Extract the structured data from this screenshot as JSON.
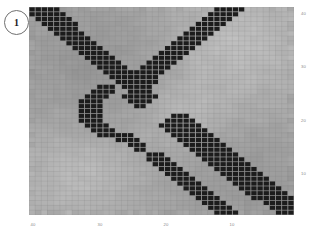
{
  "figure": {
    "panel_label": "1",
    "background_color": "#ffffff"
  },
  "chart_data": {
    "type": "heatmap",
    "title": "",
    "subtitle": "",
    "xlabel": "",
    "ylabel": "",
    "grid": true,
    "legend": "none",
    "colormap": "grays",
    "color_low": "#1c1c1c",
    "color_high": "#d8d8d8",
    "background_color": "#9f9f9f",
    "xlim": [
      45,
      2
    ],
    "ylim": [
      45,
      2
    ],
    "x_ticks": [
      40,
      30,
      20,
      10
    ],
    "x_tick_labels": [
      "40",
      "30",
      "20",
      "10"
    ],
    "x_tick_positions_px": [
      33,
      100,
      166,
      232
    ],
    "y_ticks": [
      40,
      30,
      20,
      10
    ],
    "y_tick_labels": [
      "40",
      "30",
      "20",
      "10"
    ],
    "y_tick_positions_px": [
      14,
      67,
      121,
      174
    ],
    "n_rows": 43,
    "n_cols": 43,
    "cell_px": 6.16,
    "value_levels": {
      "dark": 0.06,
      "mid_dark": 0.58,
      "mid": 0.64,
      "mid_light": 0.72,
      "light": 0.83
    },
    "dark_cells": [
      [
        0,
        0
      ],
      [
        0,
        1
      ],
      [
        0,
        2
      ],
      [
        0,
        3
      ],
      [
        0,
        4
      ],
      [
        0,
        30
      ],
      [
        0,
        31
      ],
      [
        0,
        32
      ],
      [
        0,
        33
      ],
      [
        0,
        34
      ],
      [
        1,
        0
      ],
      [
        1,
        1
      ],
      [
        1,
        2
      ],
      [
        1,
        3
      ],
      [
        1,
        4
      ],
      [
        1,
        5
      ],
      [
        1,
        29
      ],
      [
        1,
        30
      ],
      [
        1,
        31
      ],
      [
        1,
        32
      ],
      [
        1,
        33
      ],
      [
        2,
        1
      ],
      [
        2,
        2
      ],
      [
        2,
        3
      ],
      [
        2,
        4
      ],
      [
        2,
        5
      ],
      [
        2,
        6
      ],
      [
        2,
        28
      ],
      [
        2,
        29
      ],
      [
        2,
        30
      ],
      [
        2,
        31
      ],
      [
        2,
        32
      ],
      [
        3,
        2
      ],
      [
        3,
        3
      ],
      [
        3,
        4
      ],
      [
        3,
        5
      ],
      [
        3,
        6
      ],
      [
        3,
        7
      ],
      [
        3,
        27
      ],
      [
        3,
        28
      ],
      [
        3,
        29
      ],
      [
        3,
        30
      ],
      [
        3,
        31
      ],
      [
        4,
        3
      ],
      [
        4,
        4
      ],
      [
        4,
        5
      ],
      [
        4,
        6
      ],
      [
        4,
        7
      ],
      [
        4,
        26
      ],
      [
        4,
        27
      ],
      [
        4,
        28
      ],
      [
        4,
        29
      ],
      [
        4,
        30
      ],
      [
        5,
        4
      ],
      [
        5,
        5
      ],
      [
        5,
        6
      ],
      [
        5,
        7
      ],
      [
        5,
        8
      ],
      [
        5,
        25
      ],
      [
        5,
        26
      ],
      [
        5,
        27
      ],
      [
        5,
        28
      ],
      [
        5,
        29
      ],
      [
        6,
        5
      ],
      [
        6,
        6
      ],
      [
        6,
        7
      ],
      [
        6,
        8
      ],
      [
        6,
        9
      ],
      [
        6,
        24
      ],
      [
        6,
        25
      ],
      [
        6,
        26
      ],
      [
        6,
        27
      ],
      [
        6,
        28
      ],
      [
        7,
        6
      ],
      [
        7,
        7
      ],
      [
        7,
        8
      ],
      [
        7,
        9
      ],
      [
        7,
        10
      ],
      [
        7,
        23
      ],
      [
        7,
        24
      ],
      [
        7,
        25
      ],
      [
        7,
        26
      ],
      [
        7,
        27
      ],
      [
        8,
        7
      ],
      [
        8,
        8
      ],
      [
        8,
        9
      ],
      [
        8,
        10
      ],
      [
        8,
        11
      ],
      [
        8,
        22
      ],
      [
        8,
        23
      ],
      [
        8,
        24
      ],
      [
        8,
        25
      ],
      [
        8,
        26
      ],
      [
        9,
        8
      ],
      [
        9,
        9
      ],
      [
        9,
        10
      ],
      [
        9,
        11
      ],
      [
        9,
        12
      ],
      [
        9,
        21
      ],
      [
        9,
        22
      ],
      [
        9,
        23
      ],
      [
        9,
        24
      ],
      [
        9,
        25
      ],
      [
        10,
        9
      ],
      [
        10,
        10
      ],
      [
        10,
        11
      ],
      [
        10,
        12
      ],
      [
        10,
        13
      ],
      [
        10,
        20
      ],
      [
        10,
        21
      ],
      [
        10,
        22
      ],
      [
        10,
        23
      ],
      [
        10,
        24
      ],
      [
        11,
        10
      ],
      [
        11,
        11
      ],
      [
        11,
        12
      ],
      [
        11,
        13
      ],
      [
        11,
        14
      ],
      [
        11,
        19
      ],
      [
        11,
        20
      ],
      [
        11,
        21
      ],
      [
        11,
        22
      ],
      [
        11,
        23
      ],
      [
        12,
        11
      ],
      [
        12,
        12
      ],
      [
        12,
        13
      ],
      [
        12,
        14
      ],
      [
        12,
        15
      ],
      [
        12,
        18
      ],
      [
        12,
        19
      ],
      [
        12,
        20
      ],
      [
        12,
        21
      ],
      [
        12,
        22
      ],
      [
        13,
        12
      ],
      [
        13,
        13
      ],
      [
        13,
        14
      ],
      [
        13,
        15
      ],
      [
        13,
        16
      ],
      [
        13,
        17
      ],
      [
        13,
        18
      ],
      [
        13,
        19
      ],
      [
        13,
        20
      ],
      [
        13,
        21
      ],
      [
        14,
        13
      ],
      [
        14,
        14
      ],
      [
        14,
        15
      ],
      [
        14,
        16
      ],
      [
        14,
        17
      ],
      [
        14,
        18
      ],
      [
        14,
        19
      ],
      [
        14,
        20
      ],
      [
        15,
        14
      ],
      [
        15,
        15
      ],
      [
        15,
        16
      ],
      [
        15,
        17
      ],
      [
        15,
        18
      ],
      [
        15,
        19
      ],
      [
        15,
        20
      ],
      [
        16,
        11
      ],
      [
        16,
        12
      ],
      [
        16,
        13
      ],
      [
        16,
        15
      ],
      [
        16,
        16
      ],
      [
        16,
        17
      ],
      [
        16,
        18
      ],
      [
        16,
        19
      ],
      [
        17,
        10
      ],
      [
        17,
        11
      ],
      [
        17,
        12
      ],
      [
        17,
        13
      ],
      [
        17,
        16
      ],
      [
        17,
        17
      ],
      [
        17,
        18
      ],
      [
        17,
        19
      ],
      [
        18,
        9
      ],
      [
        18,
        10
      ],
      [
        18,
        11
      ],
      [
        18,
        12
      ],
      [
        18,
        15
      ],
      [
        18,
        16
      ],
      [
        18,
        17
      ],
      [
        18,
        18
      ],
      [
        18,
        19
      ],
      [
        18,
        20
      ],
      [
        19,
        8
      ],
      [
        19,
        9
      ],
      [
        19,
        10
      ],
      [
        19,
        11
      ],
      [
        19,
        16
      ],
      [
        19,
        17
      ],
      [
        19,
        18
      ],
      [
        19,
        19
      ],
      [
        20,
        8
      ],
      [
        20,
        9
      ],
      [
        20,
        10
      ],
      [
        20,
        11
      ],
      [
        20,
        17
      ],
      [
        20,
        18
      ],
      [
        21,
        8
      ],
      [
        21,
        9
      ],
      [
        21,
        10
      ],
      [
        21,
        11
      ],
      [
        22,
        8
      ],
      [
        22,
        9
      ],
      [
        22,
        10
      ],
      [
        22,
        11
      ],
      [
        22,
        23
      ],
      [
        22,
        24
      ],
      [
        22,
        25
      ],
      [
        23,
        8
      ],
      [
        23,
        9
      ],
      [
        23,
        10
      ],
      [
        23,
        11
      ],
      [
        23,
        22
      ],
      [
        23,
        23
      ],
      [
        23,
        24
      ],
      [
        23,
        25
      ],
      [
        23,
        26
      ],
      [
        24,
        9
      ],
      [
        24,
        10
      ],
      [
        24,
        11
      ],
      [
        24,
        12
      ],
      [
        24,
        21
      ],
      [
        24,
        22
      ],
      [
        24,
        23
      ],
      [
        24,
        24
      ],
      [
        24,
        25
      ],
      [
        24,
        26
      ],
      [
        24,
        27
      ],
      [
        25,
        10
      ],
      [
        25,
        11
      ],
      [
        25,
        12
      ],
      [
        25,
        13
      ],
      [
        25,
        22
      ],
      [
        25,
        23
      ],
      [
        25,
        24
      ],
      [
        25,
        25
      ],
      [
        25,
        26
      ],
      [
        25,
        27
      ],
      [
        25,
        28
      ],
      [
        26,
        11
      ],
      [
        26,
        12
      ],
      [
        26,
        13
      ],
      [
        26,
        14
      ],
      [
        26,
        15
      ],
      [
        26,
        16
      ],
      [
        26,
        23
      ],
      [
        26,
        24
      ],
      [
        26,
        25
      ],
      [
        26,
        26
      ],
      [
        26,
        27
      ],
      [
        26,
        28
      ],
      [
        26,
        29
      ],
      [
        27,
        14
      ],
      [
        27,
        15
      ],
      [
        27,
        16
      ],
      [
        27,
        17
      ],
      [
        27,
        24
      ],
      [
        27,
        25
      ],
      [
        27,
        26
      ],
      [
        27,
        27
      ],
      [
        27,
        28
      ],
      [
        27,
        29
      ],
      [
        27,
        30
      ],
      [
        28,
        16
      ],
      [
        28,
        17
      ],
      [
        28,
        18
      ],
      [
        28,
        25
      ],
      [
        28,
        26
      ],
      [
        28,
        27
      ],
      [
        28,
        28
      ],
      [
        28,
        29
      ],
      [
        28,
        30
      ],
      [
        28,
        31
      ],
      [
        29,
        17
      ],
      [
        29,
        18
      ],
      [
        29,
        26
      ],
      [
        29,
        27
      ],
      [
        29,
        28
      ],
      [
        29,
        29
      ],
      [
        29,
        30
      ],
      [
        29,
        31
      ],
      [
        29,
        32
      ],
      [
        30,
        19
      ],
      [
        30,
        20
      ],
      [
        30,
        21
      ],
      [
        30,
        27
      ],
      [
        30,
        28
      ],
      [
        30,
        29
      ],
      [
        30,
        30
      ],
      [
        30,
        31
      ],
      [
        30,
        32
      ],
      [
        30,
        33
      ],
      [
        31,
        19
      ],
      [
        31,
        20
      ],
      [
        31,
        21
      ],
      [
        31,
        22
      ],
      [
        31,
        28
      ],
      [
        31,
        29
      ],
      [
        31,
        30
      ],
      [
        31,
        31
      ],
      [
        31,
        32
      ],
      [
        31,
        33
      ],
      [
        31,
        34
      ],
      [
        32,
        20
      ],
      [
        32,
        21
      ],
      [
        32,
        22
      ],
      [
        32,
        23
      ],
      [
        32,
        29
      ],
      [
        32,
        30
      ],
      [
        32,
        31
      ],
      [
        32,
        32
      ],
      [
        32,
        33
      ],
      [
        32,
        34
      ],
      [
        32,
        35
      ],
      [
        33,
        21
      ],
      [
        33,
        22
      ],
      [
        33,
        23
      ],
      [
        33,
        24
      ],
      [
        33,
        30
      ],
      [
        33,
        31
      ],
      [
        33,
        32
      ],
      [
        33,
        33
      ],
      [
        33,
        34
      ],
      [
        33,
        35
      ],
      [
        33,
        36
      ],
      [
        34,
        22
      ],
      [
        34,
        23
      ],
      [
        34,
        24
      ],
      [
        34,
        25
      ],
      [
        34,
        31
      ],
      [
        34,
        32
      ],
      [
        34,
        33
      ],
      [
        34,
        34
      ],
      [
        34,
        35
      ],
      [
        34,
        36
      ],
      [
        34,
        37
      ],
      [
        35,
        23
      ],
      [
        35,
        24
      ],
      [
        35,
        25
      ],
      [
        35,
        26
      ],
      [
        35,
        32
      ],
      [
        35,
        33
      ],
      [
        35,
        34
      ],
      [
        35,
        35
      ],
      [
        35,
        36
      ],
      [
        35,
        37
      ],
      [
        35,
        38
      ],
      [
        36,
        24
      ],
      [
        36,
        25
      ],
      [
        36,
        26
      ],
      [
        36,
        27
      ],
      [
        36,
        33
      ],
      [
        36,
        34
      ],
      [
        36,
        35
      ],
      [
        36,
        36
      ],
      [
        36,
        37
      ],
      [
        36,
        38
      ],
      [
        36,
        39
      ],
      [
        37,
        25
      ],
      [
        37,
        26
      ],
      [
        37,
        27
      ],
      [
        37,
        28
      ],
      [
        37,
        34
      ],
      [
        37,
        35
      ],
      [
        37,
        36
      ],
      [
        37,
        37
      ],
      [
        37,
        38
      ],
      [
        37,
        39
      ],
      [
        37,
        40
      ],
      [
        38,
        26
      ],
      [
        38,
        27
      ],
      [
        38,
        28
      ],
      [
        38,
        29
      ],
      [
        38,
        35
      ],
      [
        38,
        36
      ],
      [
        38,
        37
      ],
      [
        38,
        38
      ],
      [
        38,
        39
      ],
      [
        38,
        40
      ],
      [
        38,
        41
      ],
      [
        39,
        27
      ],
      [
        39,
        28
      ],
      [
        39,
        29
      ],
      [
        39,
        30
      ],
      [
        39,
        36
      ],
      [
        39,
        37
      ],
      [
        39,
        38
      ],
      [
        39,
        39
      ],
      [
        39,
        40
      ],
      [
        39,
        41
      ],
      [
        39,
        42
      ],
      [
        40,
        28
      ],
      [
        40,
        29
      ],
      [
        40,
        30
      ],
      [
        40,
        31
      ],
      [
        40,
        38
      ],
      [
        40,
        39
      ],
      [
        40,
        40
      ],
      [
        40,
        41
      ],
      [
        40,
        42
      ],
      [
        41,
        29
      ],
      [
        41,
        30
      ],
      [
        41,
        31
      ],
      [
        41,
        32
      ],
      [
        41,
        39
      ],
      [
        41,
        40
      ],
      [
        41,
        41
      ],
      [
        41,
        42
      ],
      [
        42,
        30
      ],
      [
        42,
        31
      ],
      [
        42,
        32
      ],
      [
        42,
        33
      ],
      [
        42,
        40
      ],
      [
        42,
        41
      ],
      [
        42,
        42
      ]
    ]
  }
}
